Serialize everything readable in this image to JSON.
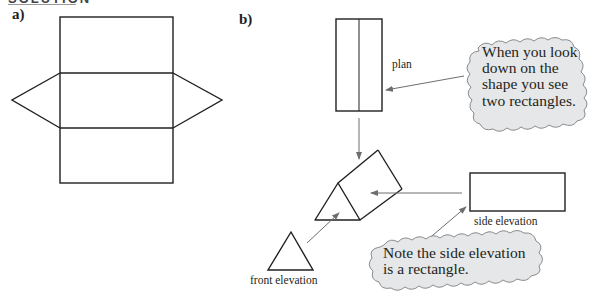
{
  "heading": {
    "text": "SOLUTION"
  },
  "part_a": {
    "label": "a)"
  },
  "part_b": {
    "label": "b)",
    "plan_label": "plan",
    "side_elevation_label": "side elevation",
    "front_elevation_label": "front elevation",
    "callout_plan": {
      "lines": [
        "When you look",
        "down on the",
        "shape you see",
        "two rectangles."
      ]
    },
    "callout_side": {
      "lines": [
        "Note the side elevation",
        "is a rectangle."
      ]
    }
  },
  "colors": {
    "stroke": "#231f20",
    "arrow": "#6d6e71",
    "bubble_fill": "#e6e7e8",
    "bubble_stroke": "#8a8b8d"
  }
}
